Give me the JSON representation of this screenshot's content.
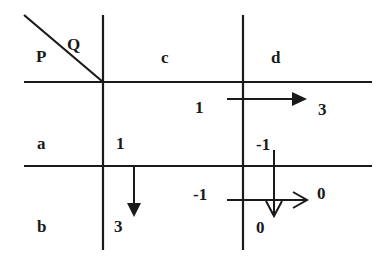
{
  "diagram": {
    "type": "payoff-matrix-game",
    "corner": {
      "row_player": "P",
      "col_player": "Q"
    },
    "columns": [
      "c",
      "d"
    ],
    "rows": [
      "a",
      "b"
    ],
    "cells": {
      "a_c": {
        "payoff": "1"
      },
      "a_d": {
        "payoff_left": "1",
        "payoff_top": "-1",
        "payoff_right": "3"
      },
      "b_c": {
        "payoff": "3"
      },
      "b_d": {
        "payoff_left": "-1",
        "payoff_right": "0",
        "payoff_bottom": "0"
      }
    },
    "labels": {
      "P": "P",
      "Q": "Q",
      "col_c": "c",
      "col_d": "d",
      "row_a": "a",
      "row_b": "b",
      "ac_val": "1",
      "bc_val": "3",
      "ad_left": "1",
      "ad_right": "3",
      "ad_top": "-1",
      "bd_left": "-1",
      "bd_right": "0",
      "bd_bottom": "0"
    },
    "arrows": [
      {
        "name": "arrow-ad-right",
        "style": "filled",
        "direction": "right",
        "from": "1",
        "to": "3"
      },
      {
        "name": "arrow-ac-down",
        "style": "filled",
        "direction": "down",
        "from": "1",
        "to": "3"
      },
      {
        "name": "arrow-d-down",
        "style": "open",
        "direction": "down",
        "from": "-1",
        "to": "0"
      },
      {
        "name": "arrow-bd-right",
        "style": "open",
        "direction": "right",
        "from": "-1",
        "to": "0"
      }
    ],
    "colors": {
      "ink": "#1a1a1a",
      "background": "#ffffff"
    }
  }
}
